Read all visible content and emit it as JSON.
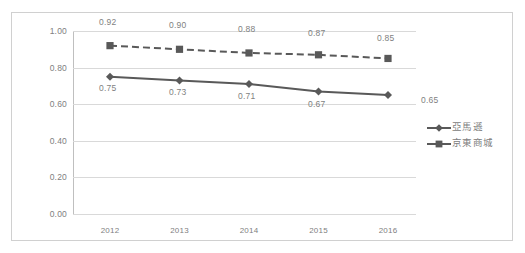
{
  "chart_data": {
    "type": "line",
    "title": "",
    "subtitle": "",
    "xlabel": "",
    "ylabel": "",
    "categories": [
      "2012",
      "2013",
      "2014",
      "2015",
      "2016"
    ],
    "ylim": [
      0.0,
      1.0
    ],
    "ytick_labels": [
      "0.00",
      "0.20",
      "0.40",
      "0.60",
      "0.80",
      "1.00"
    ],
    "ytick_values": [
      0.0,
      0.2,
      0.4,
      0.6,
      0.8,
      1.0
    ],
    "grid": true,
    "legend_position": "right",
    "series": [
      {
        "name": "亞馬遜",
        "values": [
          0.75,
          0.73,
          0.71,
          0.67,
          0.65
        ],
        "data_labels": [
          "0.75",
          "0.73",
          "0.71",
          "0.67",
          "0.65"
        ],
        "line_style": "solid",
        "marker": "diamond",
        "color": "#595959"
      },
      {
        "name": "京東商城",
        "values": [
          0.92,
          0.9,
          0.88,
          0.87,
          0.85
        ],
        "data_labels": [
          "0.92",
          "0.90",
          "0.88",
          "0.87",
          "0.85"
        ],
        "line_style": "dashed",
        "marker": "square",
        "color": "#595959"
      }
    ]
  },
  "colors": {
    "series_line": "#595959",
    "gridline": "#d9d9d9",
    "axis": "#bfbfbf",
    "tick_text": "#808080",
    "label_text": "#7f7f7f",
    "border": "#d0d0d0",
    "background": "#ffffff"
  }
}
